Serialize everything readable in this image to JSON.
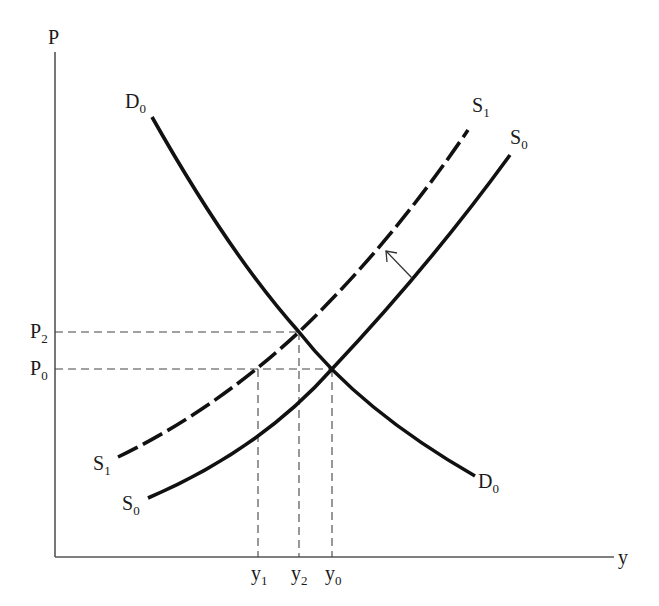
{
  "diagram": {
    "type": "supply-demand",
    "axes": {
      "y_label": "P",
      "x_label": "y",
      "color": "#555555"
    },
    "curves": {
      "demand": {
        "name": "D",
        "sub": "0",
        "style": "solid"
      },
      "supply_initial": {
        "name": "S",
        "sub": "0",
        "style": "solid"
      },
      "supply_shifted": {
        "name": "S",
        "sub": "1",
        "style": "dashed"
      }
    },
    "price_labels": [
      {
        "name": "P",
        "sub": "2"
      },
      {
        "name": "P",
        "sub": "0"
      }
    ],
    "quantity_labels": [
      {
        "name": "y",
        "sub": "1"
      },
      {
        "name": "y",
        "sub": "2"
      },
      {
        "name": "y",
        "sub": "0"
      }
    ],
    "annotations": {
      "shift_arrow": "leftward shift of supply from S0 to S1"
    },
    "colors": {
      "curve": "#111111",
      "guide": "#444444",
      "background": "#ffffff"
    }
  }
}
